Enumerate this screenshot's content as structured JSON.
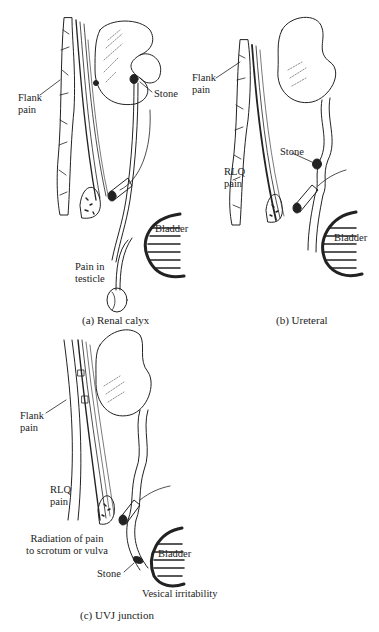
{
  "figure": {
    "panels": [
      {
        "id": "a",
        "caption": "(a) Renal calyx",
        "labels": {
          "flank_pain": [
            "Flank",
            "pain"
          ],
          "stone": "Stone",
          "bladder": "Bladder",
          "pain_in_testicle": [
            "Pain in",
            "testicle"
          ]
        }
      },
      {
        "id": "b",
        "caption": "(b) Ureteral",
        "labels": {
          "flank_pain": [
            "Flank",
            "pain"
          ],
          "stone": "Stone",
          "rlq_pain": [
            "RLQ",
            "pain"
          ],
          "bladder": "Bladder"
        }
      },
      {
        "id": "c",
        "caption": "(c) UVJ junction",
        "labels": {
          "flank_pain": [
            "Flank",
            "pain"
          ],
          "rlq_pain": [
            "RLQ",
            "pain"
          ],
          "radiation": [
            "Radiation of pain",
            "to scrotum or vulva"
          ],
          "bladder": "Bladder",
          "stone": "Stone",
          "vesical_irritability": "Vesical irritability"
        }
      }
    ],
    "colors": {
      "line": "#222222",
      "background": "#ffffff"
    }
  }
}
